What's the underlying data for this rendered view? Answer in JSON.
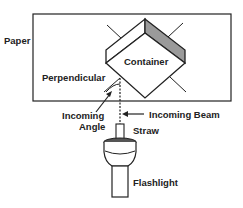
{
  "diagram": {
    "labels": {
      "paper": "Paper",
      "container": "Container",
      "perpendicular": "Perpendicular",
      "incoming_angle_line1": "Incoming",
      "incoming_angle_line2": "Angle",
      "incoming_beam": "Incoming Beam",
      "straw": "Straw",
      "flashlight": "Flashlight"
    },
    "colors": {
      "stroke": "#222222",
      "shaded_face": "#9a9a9a",
      "background": "#ffffff"
    }
  }
}
